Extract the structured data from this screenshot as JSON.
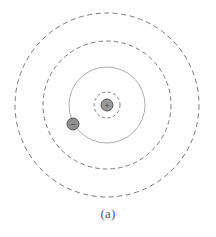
{
  "figure": {
    "caption": "(a)",
    "background_color": "#ffffff",
    "line_color": "#6e6e6e",
    "nucleus_fill": "#9a9a9a",
    "nucleus_stroke": "#4f4f4f",
    "electron_fill": "#8f8f8f",
    "electron_stroke": "#4a4a4a",
    "sign_color": "#3a3a3a"
  },
  "atom": {
    "center": {
      "x": 107,
      "y": 105
    },
    "nucleus": {
      "label": "+",
      "radius": 6,
      "fill": "#9a9a9a",
      "stroke": "#4f4f4f"
    },
    "electron": {
      "label": "−",
      "radius": 6,
      "x": 73,
      "y": 124,
      "fill": "#8f8f8f",
      "stroke": "#4a4a4a"
    },
    "shells": [
      {
        "name": "nucleus-shell",
        "radius": 13,
        "style": "dashed",
        "dash": "3 2.6",
        "stroke": "#6b6b6b",
        "width": 0.9
      },
      {
        "name": "electron-orbit",
        "radius": 38,
        "style": "solid",
        "dash": "none",
        "stroke": "#a5a5a5",
        "width": 0.9
      },
      {
        "name": "middle-shell",
        "radius": 64,
        "style": "dashed",
        "dash": "4.5 3.2",
        "stroke": "#7a7a7a",
        "width": 1.0
      },
      {
        "name": "outer-shell",
        "radius": 92,
        "style": "dashed",
        "dash": "5 3.6",
        "stroke": "#7a7a7a",
        "width": 1.0
      }
    ]
  }
}
